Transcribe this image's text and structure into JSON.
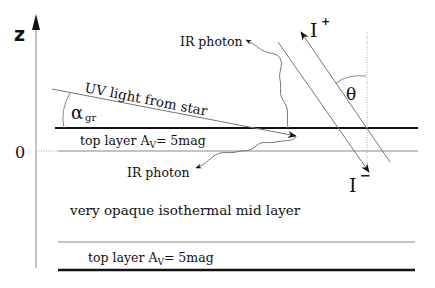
{
  "diagram": {
    "axis": {
      "label": "z",
      "origin_label": "0"
    },
    "labels": {
      "uv_light": "UV light from star",
      "alpha_symbol": "α",
      "alpha_subscript": "gr",
      "ir_photon_up": "IR photon",
      "ir_photon_down": "IR photon",
      "intensity_up": "I",
      "intensity_up_sup": "+",
      "intensity_down": "I",
      "intensity_down_sup": "−",
      "theta": "θ",
      "top_layer_upper": "top layer  A",
      "top_layer_upper_sub": "V",
      "top_layer_upper_value": "= 5mag",
      "mid_layer": "very opaque isothermal mid layer",
      "top_layer_lower": "top layer  A",
      "top_layer_lower_sub": "V",
      "top_layer_lower_value": "= 5mag"
    },
    "colors": {
      "ink": "#111111",
      "thin_line": "#777777"
    }
  }
}
